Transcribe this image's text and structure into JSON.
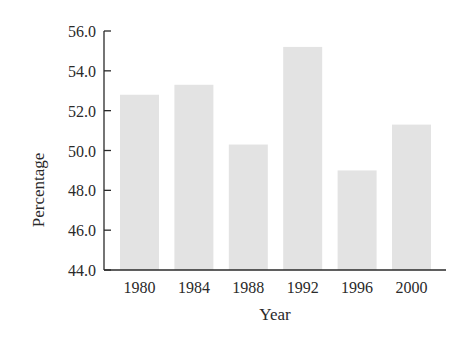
{
  "chart_data": {
    "type": "bar",
    "title": "",
    "xlabel": "Year",
    "ylabel": "Percentage",
    "categories": [
      "1980",
      "1984",
      "1988",
      "1992",
      "1996",
      "2000"
    ],
    "values": [
      52.8,
      53.3,
      50.3,
      55.2,
      49.0,
      51.3
    ],
    "ylim": [
      44.0,
      56.0
    ],
    "yticks": [
      "44.0",
      "46.0",
      "48.0",
      "50.0",
      "52.0",
      "54.0",
      "56.0"
    ],
    "grid": false,
    "legend": null,
    "bar_color": "#e3e3e3",
    "axis_color": "#2a2a2a"
  }
}
